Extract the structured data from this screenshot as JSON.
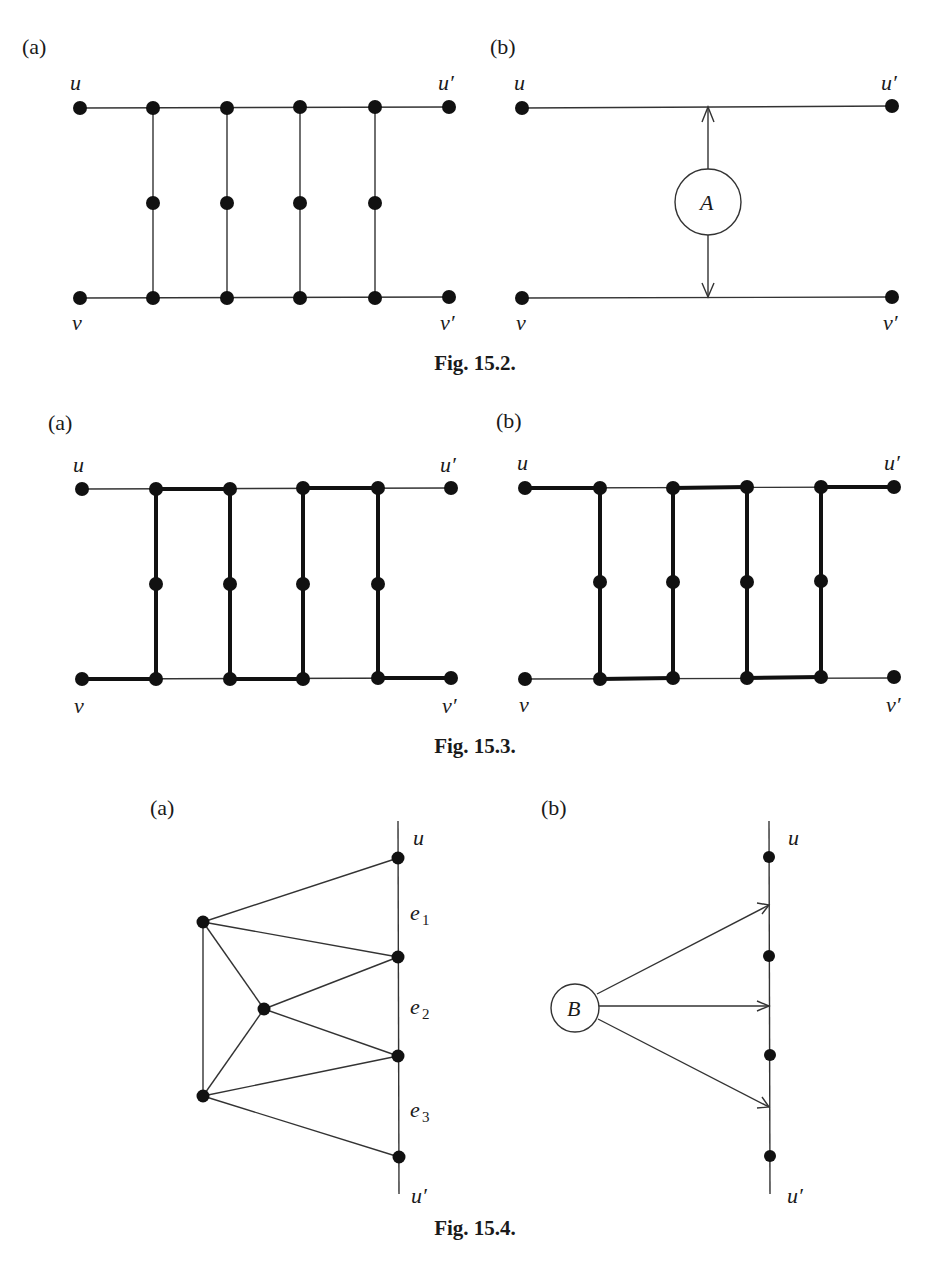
{
  "figures": {
    "fig15_2": {
      "caption": "Fig. 15.2.",
      "panel_a": {
        "label": "(a)",
        "u": "u",
        "u_prime": "u′",
        "v": "v",
        "v_prime": "v′"
      },
      "panel_b": {
        "label": "(b)",
        "u": "u",
        "u_prime": "u′",
        "v": "v",
        "v_prime": "v′",
        "block": "A"
      }
    },
    "fig15_3": {
      "caption": "Fig. 15.3.",
      "panel_a": {
        "label": "(a)",
        "u": "u",
        "u_prime": "u′",
        "v": "v",
        "v_prime": "v′"
      },
      "panel_b": {
        "label": "(b)",
        "u": "u",
        "u_prime": "u′",
        "v": "v",
        "v_prime": "v′"
      }
    },
    "fig15_4": {
      "caption": "Fig. 15.4.",
      "panel_a": {
        "label": "(a)",
        "u": "u",
        "u_prime": "u′",
        "e1": "e",
        "e1_sub": "1",
        "e2": "e",
        "e2_sub": "2",
        "e3": "e",
        "e3_sub": "3"
      },
      "panel_b": {
        "label": "(b)",
        "u": "u",
        "u_prime": "u′",
        "block": "B"
      }
    }
  },
  "colors": {
    "ink": "#111111",
    "background": "#ffffff"
  }
}
